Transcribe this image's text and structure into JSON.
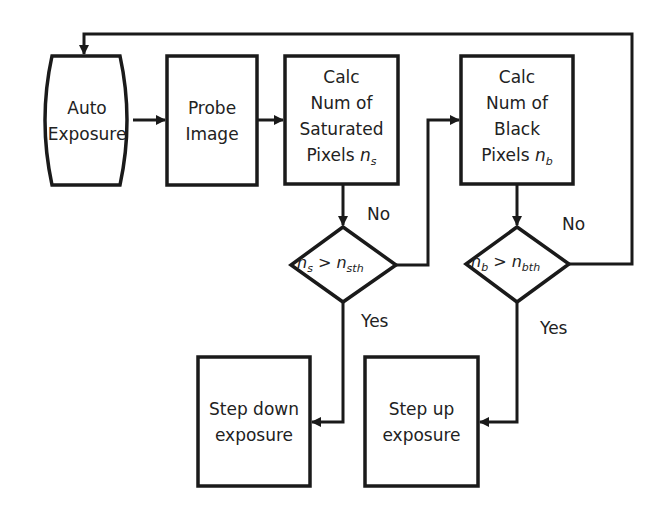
{
  "diagram": {
    "type": "flowchart",
    "nodes": {
      "auto_exposure": {
        "line1": "Auto",
        "line2": "Exposure",
        "shape": "terminator"
      },
      "probe_image": {
        "line1": "Probe",
        "line2": "Image",
        "shape": "process"
      },
      "calc_saturated": {
        "line1": "Calc",
        "line2": "Num of",
        "line3": "Saturated",
        "line4": "Pixels",
        "var": "n",
        "var_sub": "s",
        "shape": "process"
      },
      "calc_black": {
        "line1": "Calc",
        "line2": "Num of",
        "line3": "Black",
        "line4": "Pixels",
        "var": "n",
        "var_sub": "b",
        "shape": "process"
      },
      "decision_saturated": {
        "lhs": "n",
        "lhs_sub": "s",
        "op": ">",
        "rhs": "n",
        "rhs_sub": "sth",
        "shape": "decision"
      },
      "decision_black": {
        "lhs": "n",
        "lhs_sub": "b",
        "op": ">",
        "rhs": "n",
        "rhs_sub": "bth",
        "shape": "decision"
      },
      "step_down": {
        "line1": "Step down",
        "line2": "exposure",
        "shape": "process"
      },
      "step_up": {
        "line1": "Step up",
        "line2": "exposure",
        "shape": "process"
      }
    },
    "edge_labels": {
      "sat_no": "No",
      "sat_yes": "Yes",
      "black_no": "No",
      "black_yes": "Yes"
    },
    "edges": [
      {
        "from": "auto_exposure",
        "to": "probe_image"
      },
      {
        "from": "probe_image",
        "to": "calc_saturated"
      },
      {
        "from": "calc_saturated",
        "to": "decision_saturated"
      },
      {
        "from": "decision_saturated",
        "to": "calc_black",
        "label": "No"
      },
      {
        "from": "decision_saturated",
        "to": "step_down",
        "label": "Yes"
      },
      {
        "from": "calc_black",
        "to": "decision_black"
      },
      {
        "from": "decision_black",
        "to": "auto_exposure",
        "label": "No"
      },
      {
        "from": "decision_black",
        "to": "step_up",
        "label": "Yes"
      }
    ],
    "colors": {
      "stroke": "#1a1a1a",
      "background": "#ffffff",
      "text": "#222222"
    }
  }
}
